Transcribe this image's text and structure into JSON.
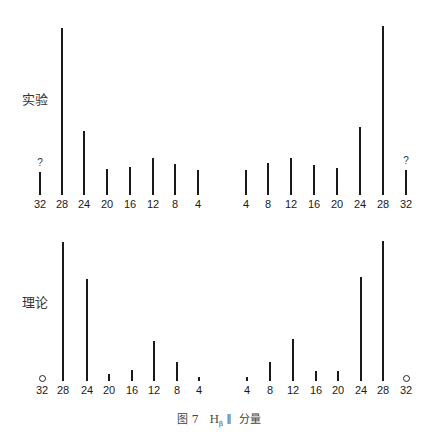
{
  "chart_data": [
    {
      "type": "bar",
      "title": "实验",
      "row_label": "实验",
      "categories": [
        "32",
        "28",
        "24",
        "20",
        "16",
        "12",
        "8",
        "4",
        "4",
        "8",
        "12",
        "16",
        "20",
        "24",
        "28",
        "32"
      ],
      "values": [
        23,
        167,
        64,
        26,
        28,
        37,
        31,
        25,
        25,
        32,
        37,
        30,
        27,
        68,
        169,
        25
      ],
      "annotations": [
        {
          "index": 0,
          "text": "?"
        },
        {
          "index": 15,
          "text": "?"
        }
      ],
      "xlabel": "",
      "ylabel": "",
      "grid": false
    },
    {
      "type": "bar",
      "title": "理论",
      "row_label": "理论",
      "categories": [
        "32",
        "28",
        "24",
        "20",
        "16",
        "12",
        "8",
        "4",
        "4",
        "8",
        "12",
        "16",
        "20",
        "24",
        "28",
        "32"
      ],
      "values": [
        0,
        139,
        102,
        7,
        11,
        40,
        19,
        4,
        4,
        19,
        42,
        10,
        10,
        104,
        140,
        0
      ],
      "annotations": [
        {
          "index": 0,
          "text": "o"
        },
        {
          "index": 15,
          "text": "o"
        }
      ],
      "xlabel": "",
      "ylabel": "",
      "grid": false
    }
  ],
  "top": {
    "label": "实验",
    "question_mark": "?",
    "baseline": 195,
    "bars": [
      {
        "label": "32",
        "x": 40,
        "h": 23,
        "marker": "?"
      },
      {
        "label": "28",
        "x": 62,
        "h": 167
      },
      {
        "label": "24",
        "x": 84,
        "h": 64
      },
      {
        "label": "20",
        "x": 107,
        "h": 26
      },
      {
        "label": "16",
        "x": 130,
        "h": 28
      },
      {
        "label": "12",
        "x": 153,
        "h": 37
      },
      {
        "label": "8",
        "x": 175,
        "h": 31
      },
      {
        "label": "4",
        "x": 198,
        "h": 25
      },
      {
        "label": "4",
        "x": 246,
        "h": 25
      },
      {
        "label": "8",
        "x": 268,
        "h": 32
      },
      {
        "label": "12",
        "x": 291,
        "h": 37
      },
      {
        "label": "16",
        "x": 314,
        "h": 30
      },
      {
        "label": "20",
        "x": 337,
        "h": 27
      },
      {
        "label": "24",
        "x": 360,
        "h": 68
      },
      {
        "label": "28",
        "x": 383,
        "h": 169
      },
      {
        "label": "32",
        "x": 406,
        "h": 25,
        "marker": "?"
      }
    ]
  },
  "bottom": {
    "label": "理论",
    "baseline": 381,
    "bars": [
      {
        "label": "32",
        "x": 42,
        "h": 0,
        "marker": "circle"
      },
      {
        "label": "28",
        "x": 63,
        "h": 139
      },
      {
        "label": "24",
        "x": 87,
        "h": 102
      },
      {
        "label": "20",
        "x": 109,
        "h": 7
      },
      {
        "label": "16",
        "x": 132,
        "h": 11
      },
      {
        "label": "12",
        "x": 154,
        "h": 40
      },
      {
        "label": "8",
        "x": 177,
        "h": 19
      },
      {
        "label": "4",
        "x": 199,
        "h": 4
      },
      {
        "label": "4",
        "x": 247,
        "h": 4
      },
      {
        "label": "8",
        "x": 270,
        "h": 19
      },
      {
        "label": "12",
        "x": 293,
        "h": 42
      },
      {
        "label": "16",
        "x": 316,
        "h": 10
      },
      {
        "label": "20",
        "x": 338,
        "h": 10
      },
      {
        "label": "24",
        "x": 361,
        "h": 104
      },
      {
        "label": "28",
        "x": 383,
        "h": 140
      },
      {
        "label": "32",
        "x": 406,
        "h": 0,
        "marker": "circle"
      }
    ]
  },
  "caption": {
    "prefix": "图 7",
    "symbol": "H",
    "subscript": "β",
    "parallel": "∥",
    "suffix": "分量"
  }
}
